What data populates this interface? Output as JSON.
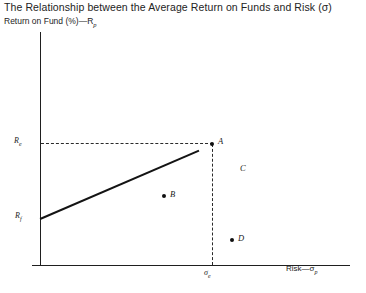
{
  "chart_data": {
    "type": "scatter",
    "title": "The Relationship between the Average Return on Funds and Risk (σ)",
    "ylabel": "Return on Fund (%)—R",
    "ylabel_sub": "p",
    "xlabel": "Risk—σ",
    "xlabel_sub": "p",
    "ytick_labels": [
      {
        "label": "R",
        "sub": "e",
        "value_note": "expected return at efficient point A"
      },
      {
        "label": "R",
        "sub": "f",
        "value_note": "risk-free rate, intercept of capital market line"
      }
    ],
    "xtick_labels": [
      {
        "label": "σ",
        "sub": "e",
        "value_note": "risk level of efficient point A"
      }
    ],
    "points": [
      {
        "name": "A",
        "label": "A",
        "x": 212,
        "y": 144,
        "marker": true,
        "note": "efficient portfolio on the line"
      },
      {
        "name": "B",
        "label": "B",
        "x": 164,
        "y": 196,
        "marker": true,
        "note": "below the line"
      },
      {
        "name": "C",
        "label": "C",
        "x": 243,
        "y": 168,
        "marker": false,
        "note": "label only, no marker"
      },
      {
        "name": "D",
        "label": "D",
        "x": 232,
        "y": 240,
        "marker": true,
        "note": "below the line, high risk"
      }
    ],
    "line": {
      "name": "capital-market-line",
      "from": {
        "label": "Rf",
        "x": 40,
        "y": 218
      },
      "to": {
        "label": "A",
        "x": 212,
        "y": 144
      }
    },
    "guides": [
      {
        "type": "horizontal-dashed",
        "from_label": "Re",
        "to_label": "A",
        "y": 143
      },
      {
        "type": "vertical-dashed",
        "from_label": "A",
        "to_label": "sigma_e",
        "x": 212
      }
    ],
    "grid": false,
    "legend": null,
    "axis_color": "#1f1f1f",
    "line_color": "#141414",
    "background": "#ffffff"
  }
}
